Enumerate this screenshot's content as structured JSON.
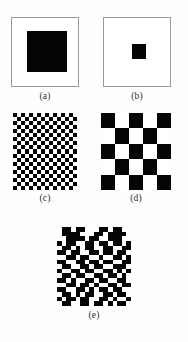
{
  "figure": {
    "background_color": "#fefefe",
    "ink_color": "#050505",
    "paper_color": "#ffffff",
    "frame_color": "#9a9a9a"
  },
  "panels": [
    {
      "id": "a",
      "label": "(a)",
      "pattern_type": "solid-square",
      "description": "large black square centered on white field",
      "framed": true,
      "fill_color": "#050505"
    },
    {
      "id": "b",
      "label": "(b)",
      "pattern_type": "solid-square",
      "description": "small black square centered on white field",
      "framed": true,
      "fill_color": "#050505"
    },
    {
      "id": "c",
      "label": "(c)",
      "pattern_type": "checkerboard",
      "description": "fine checkerboard",
      "framed": false,
      "columns": 16,
      "rows": 19,
      "fill_color": "#050505"
    },
    {
      "id": "d",
      "label": "(d)",
      "pattern_type": "checkerboard",
      "description": "coarse checkerboard",
      "framed": false,
      "columns": 5,
      "rows": 5,
      "fill_color": "#050505"
    },
    {
      "id": "e",
      "label": "(e)",
      "pattern_type": "random-binary",
      "description": "random binary noise pattern",
      "framed": false,
      "columns": 16,
      "rows": 17,
      "fill_color": "#050505",
      "bitmap": [
        "0110110001101100",
        "0111100011011110",
        "0011110110011100",
        "1011001101101101",
        "0110101100110011",
        "1101100110110110",
        "0011011001001101",
        "1100110110110011",
        "0110011011001110",
        "1001101100110101",
        "0110110011011010",
        "1101001101100110",
        "0011011010011011",
        "1100110101101100",
        "0110101100110110",
        "1011011001101001",
        "0110011011010110"
      ]
    }
  ]
}
